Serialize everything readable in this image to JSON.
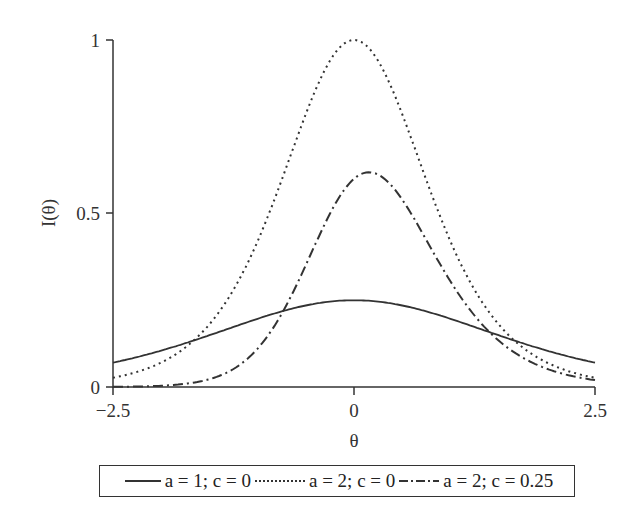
{
  "chart_data": {
    "type": "line",
    "title": "",
    "xlabel": "θ",
    "ylabel": "I(θ)",
    "xlim": [
      -2.5,
      2.5
    ],
    "ylim": [
      0,
      1
    ],
    "x_ticks": [
      "-2.5",
      "0",
      "2.5"
    ],
    "y_ticks": [
      "0",
      "0.5",
      "1"
    ],
    "grid": false,
    "legend_position": "bottom",
    "x": [
      -2.5,
      -2.0,
      -1.5,
      -1.0,
      -0.5,
      0.0,
      0.5,
      1.0,
      1.5,
      2.0,
      2.5
    ],
    "series": [
      {
        "name": "a = 1; c = 0",
        "style": "solid",
        "a": 1,
        "c": 0,
        "values": [
          0.07,
          0.105,
          0.149,
          0.197,
          0.235,
          0.25,
          0.235,
          0.197,
          0.149,
          0.105,
          0.07
        ]
      },
      {
        "name": "a = 2; c = 0",
        "style": "dotted",
        "a": 2,
        "c": 0,
        "values": [
          0.027,
          0.07,
          0.181,
          0.42,
          0.786,
          1.0,
          0.786,
          0.42,
          0.181,
          0.07,
          0.027
        ]
      },
      {
        "name": "a = 2; c = 0.25",
        "style": "dash-dot",
        "a": 2,
        "c": 0.25,
        "values": [
          0.002,
          0.012,
          0.059,
          0.216,
          0.497,
          0.617,
          0.534,
          0.288,
          0.125,
          0.048,
          0.018
        ]
      }
    ]
  },
  "axes": {
    "x_label": "θ",
    "y_label": "I(θ)",
    "x_ticks": [
      "−2.5",
      "0",
      "2.5"
    ],
    "y_ticks": [
      "0",
      "0.5",
      "1"
    ]
  },
  "legend": {
    "items": [
      {
        "label": "a = 1; c = 0"
      },
      {
        "label": "a = 2; c = 0"
      },
      {
        "label": "a = 2; c = 0.25"
      }
    ]
  }
}
